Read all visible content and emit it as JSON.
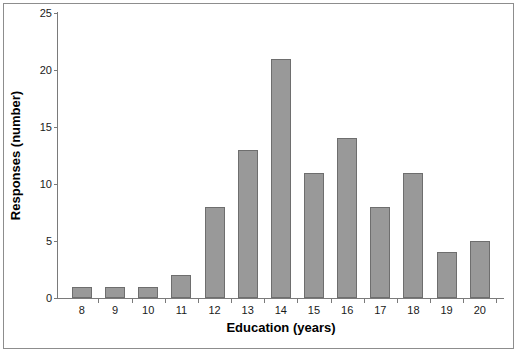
{
  "chart_data": {
    "type": "bar",
    "title": "",
    "subtitle": "",
    "xlabel": "Education (years)",
    "ylabel": "Responses (number)",
    "categories": [
      "8",
      "9",
      "10",
      "11",
      "12",
      "13",
      "14",
      "15",
      "16",
      "17",
      "18",
      "19",
      "20"
    ],
    "values": [
      1,
      1,
      1,
      2,
      8,
      13,
      21,
      11,
      14,
      8,
      11,
      4,
      5
    ],
    "ylim": [
      0,
      25
    ],
    "yticks": [
      0,
      5,
      10,
      15,
      20,
      25
    ],
    "ytick_labels": [
      "0",
      "5",
      "10",
      "15",
      "20",
      "25"
    ],
    "grid": false,
    "legend": null,
    "legend_position": "none",
    "annotations": [],
    "colors": {
      "bar_fill": "#999999",
      "bar_border": "#6e6e6e",
      "axis_line": "#7a7a7a",
      "frame_border": "#8d8d8d",
      "background": "#ffffff",
      "text": "#000000"
    }
  }
}
